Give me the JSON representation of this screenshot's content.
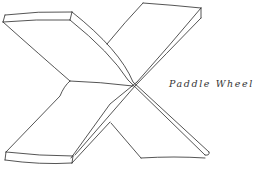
{
  "figure": {
    "caption": "Paddle Wheel",
    "stroke_color": "#2a2a2a",
    "background_color": "#ffffff"
  }
}
